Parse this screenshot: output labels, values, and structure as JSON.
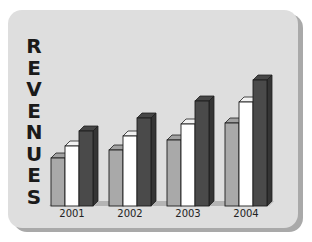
{
  "chart_data": {
    "type": "bar",
    "style": "3d-clustered-column",
    "title": "",
    "xlabel": "",
    "ylabel": "REVENUES",
    "categories": [
      "2001",
      "2002",
      "2003",
      "2004"
    ],
    "series": [
      {
        "name": "Series 1",
        "color": "#a9a9a9",
        "values": [
          48,
          56,
          66,
          83
        ]
      },
      {
        "name": "Series 2",
        "color": "#ffffff",
        "values": [
          60,
          70,
          82,
          104
        ]
      },
      {
        "name": "Series 3",
        "color": "#4a4a4a",
        "values": [
          75,
          88,
          105,
          126
        ]
      }
    ],
    "ylim": [
      0,
      130
    ],
    "grid": false,
    "legend": "none",
    "axis_ticks_visible": false
  },
  "ylabel_letters": [
    "R",
    "E",
    "V",
    "E",
    "N",
    "U",
    "E",
    "S"
  ],
  "colors": {
    "panel": "#dedede",
    "panel_shadow": "#a9a9a9",
    "floor": "#b4b4b4",
    "outline": "#1e1e1e"
  }
}
